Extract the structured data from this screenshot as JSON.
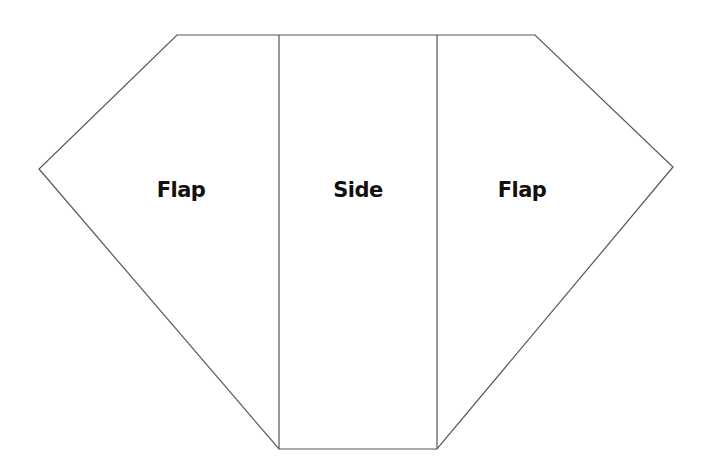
{
  "diagram": {
    "title": "",
    "stroke_color": "#555555",
    "panels": [
      {
        "id": "left-flap",
        "label": "Flap"
      },
      {
        "id": "side",
        "label": "Side"
      },
      {
        "id": "right-flap",
        "label": "Flap"
      }
    ]
  }
}
